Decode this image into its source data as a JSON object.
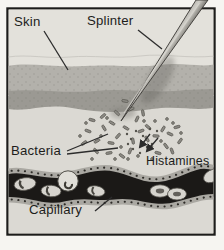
{
  "labels": {
    "skin": "Skin",
    "splinter": "Splinter",
    "bacteria": "Bacteria",
    "histamines": "Histamines",
    "capillary": "Capillary"
  },
  "colors": {
    "page": "#f6f5f1",
    "ink": "#1d1d1b",
    "bg_top": "#e3e1db",
    "band_mid": "#b3b1ab",
    "band_dark": "#9b9993",
    "dermis": "#dbd9d3",
    "capillary_lumen": "#1b1917",
    "capillary_wall": "#aaa8a2",
    "wall_dots": "#2e2c28",
    "blood_cell": "#d6d4ce",
    "splinter_light": "#cfcdc7",
    "splinter_dark": "#63615b",
    "bacteria": "#8d8b85",
    "histamine_dot": "#54524c",
    "pointer_line": "#2c2c2c"
  }
}
